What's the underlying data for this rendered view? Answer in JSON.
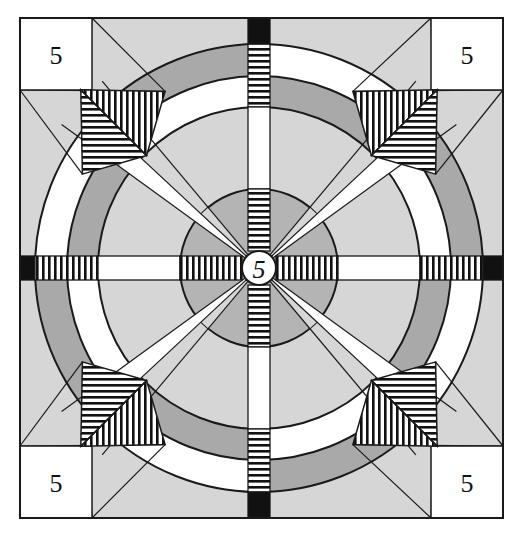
{
  "diagram": {
    "frame": {
      "x": 20,
      "y": 18,
      "width": 483,
      "height": 500
    },
    "center": {
      "x": 259,
      "y": 268
    },
    "radii": {
      "center_circle": 17,
      "inner_disc": 79,
      "middle_ring_inner": 161,
      "ring_split": 192,
      "outer_circle": 224
    },
    "bar_half_width": 11,
    "colors": {
      "background_light_gray": "#d6d6d6",
      "dark_gray": "#a9a9a9",
      "inner_disc_gray": "#b4b4b4",
      "white": "#ffffff",
      "black": "#111111",
      "stroke": "#1a1a1a"
    },
    "outer_ring_pattern_clockwise_from_north": [
      "white",
      "dark",
      "white",
      "dark",
      "white",
      "dark",
      "white",
      "dark"
    ],
    "center_label": "5",
    "corner_labels": {
      "top_left": "5",
      "top_right": "5",
      "bottom_left": "5",
      "bottom_right": "5"
    },
    "corner_square_size": 72,
    "hatching": {
      "bars": "horizontal stripes on vertical arms, vertical stripes on horizontal arms",
      "diagonals": "chevron hatching: vertical and horizontal halves"
    }
  }
}
